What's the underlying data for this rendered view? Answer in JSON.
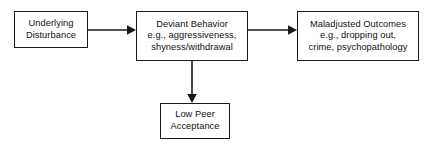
{
  "diagram": {
    "background_color": "#ffffff",
    "stroke_color": "#1a1a1a",
    "text_color": "#111111",
    "nodes": [
      {
        "id": "underlying-disturbance",
        "lines": [
          "Underlying",
          "Disturbance"
        ],
        "line1": "Underlying",
        "line2": "Disturbance",
        "line3": ""
      },
      {
        "id": "deviant-behavior",
        "lines": [
          "Deviant Behavior",
          "e.g., aggressiveness,",
          "shyness/withdrawal"
        ],
        "line1": "Deviant Behavior",
        "line2": "e.g., aggressiveness,",
        "line3": "shyness/withdrawal"
      },
      {
        "id": "maladjusted-outcomes",
        "lines": [
          "Maladjusted Outcomes",
          "e.g., dropping out,",
          "crime, psychopathology"
        ],
        "line1": "Maladjusted Outcomes",
        "line2": "e.g., dropping out,",
        "line3": "crime, psychopathology"
      },
      {
        "id": "low-peer-acceptance",
        "lines": [
          "Low Peer",
          "Acceptance"
        ],
        "line1": "Low Peer",
        "line2": "Acceptance",
        "line3": ""
      }
    ],
    "edges": [
      {
        "id": "disturbance-to-behavior",
        "from": "underlying-disturbance",
        "to": "deviant-behavior",
        "direction": "right",
        "label": ""
      },
      {
        "id": "behavior-to-outcomes",
        "from": "deviant-behavior",
        "to": "maladjusted-outcomes",
        "direction": "right",
        "label": ""
      },
      {
        "id": "behavior-to-peer",
        "from": "deviant-behavior",
        "to": "low-peer-acceptance",
        "direction": "down",
        "label": ""
      }
    ]
  }
}
